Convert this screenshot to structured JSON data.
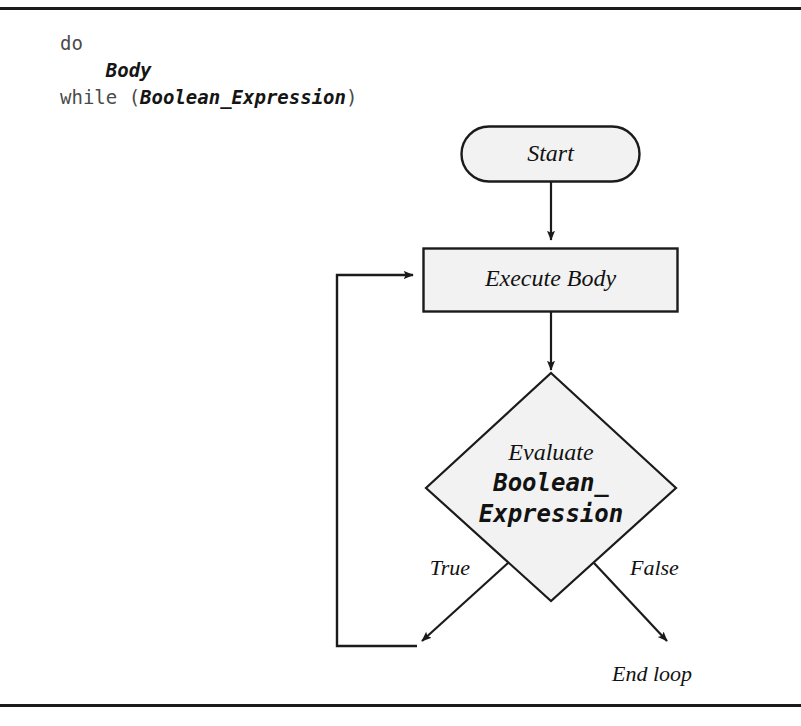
{
  "figure": {
    "kind": "flowchart",
    "rules": {
      "top": "horizontal-rule",
      "bottom": "horizontal-rule"
    }
  },
  "code": {
    "line1_keyword": "do",
    "line2_placeholder": "Body",
    "line3_keyword": "while (",
    "line3_placeholder": "Boolean_Expression",
    "line3_close": ")"
  },
  "nodes": {
    "start": {
      "label": "Start",
      "shape": "rounded-rectangle"
    },
    "execute_body": {
      "label": "Execute Body",
      "shape": "rectangle"
    },
    "decision": {
      "shape": "diamond",
      "line1": "Evaluate",
      "line2": "Boolean_",
      "line3": "Expression"
    }
  },
  "edges": {
    "true_label": "True",
    "false_label": "False",
    "end_label": "End loop"
  },
  "colors": {
    "stroke": "#1b1b1b",
    "node_fill": "#f2f2f2",
    "text": "#121212",
    "code_text": "#4a4a4a",
    "page_bg": "#ffffff"
  }
}
